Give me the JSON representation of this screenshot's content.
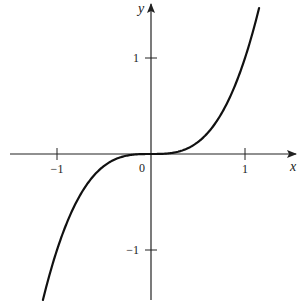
{
  "chart_data": {
    "type": "line",
    "title": "",
    "function": "y = x^3",
    "xlabel": "x",
    "ylabel": "y",
    "xlim": [
      -1.55,
      1.45
    ],
    "ylim": [
      -1.5,
      1.55
    ],
    "x_ticks": [
      -1,
      0,
      1
    ],
    "y_ticks": [
      -1,
      1
    ],
    "x_tick_labels": [
      "−1",
      "0",
      "1"
    ],
    "y_tick_labels": [
      "−1",
      "1"
    ],
    "grid": false,
    "legend": null,
    "series": [
      {
        "name": "y = x^3",
        "x": [
          -1.15,
          -1.0,
          -0.75,
          -0.5,
          -0.25,
          0,
          0.25,
          0.5,
          0.75,
          1.0,
          1.15
        ],
        "values": [
          -1.52,
          -1.0,
          -0.42,
          -0.125,
          -0.016,
          0,
          0.016,
          0.125,
          0.42,
          1.0,
          1.52
        ]
      }
    ]
  },
  "labels": {
    "x_axis": "x",
    "y_axis": "y",
    "origin": "0",
    "x_pos1": "1",
    "x_neg1": "−1",
    "y_pos1": "1",
    "y_neg1": "−1"
  },
  "colors": {
    "axis": "#222222",
    "curve": "#111111",
    "background": "#ffffff"
  }
}
